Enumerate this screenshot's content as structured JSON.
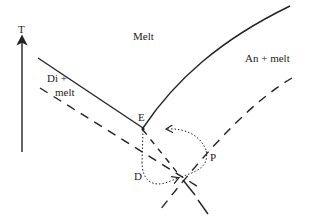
{
  "diagram": {
    "axis_label": "T",
    "regions": {
      "melt": "Melt",
      "di_melt_line1": "Di +",
      "di_melt_line2": "melt",
      "an_melt": "An + melt"
    },
    "points": {
      "eutectic": "E",
      "d": "D",
      "p": "P"
    },
    "colors": {
      "ink": "#222222",
      "background": "#ffffff"
    }
  }
}
